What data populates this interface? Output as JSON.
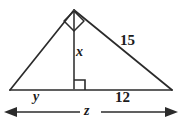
{
  "figure": {
    "kind": "geometry-diagram",
    "stroke_color": "#2b2b2b",
    "background_color": "#ffffff",
    "labels": {
      "hypotenuse_right": "15",
      "altitude": "x",
      "base_left_segment": "y",
      "base_right_segment": "12",
      "overall_base": "z"
    },
    "markers": {
      "apex_right_angle": "right-angle-square",
      "foot_right_angle": "right-angle-square"
    },
    "geometry": {
      "apex": [
        74,
        10
      ],
      "left_vertex": [
        10,
        90
      ],
      "right_vertex": [
        172,
        90
      ],
      "altitude_foot": [
        74,
        90
      ],
      "dimension_line_y": 112,
      "dimension_line_x_start": 6,
      "dimension_line_x_end": 176
    }
  }
}
